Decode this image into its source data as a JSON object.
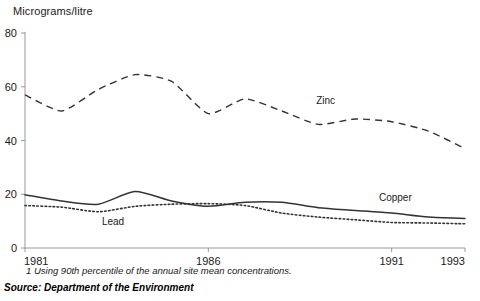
{
  "axis_title": "Micrograms/litre",
  "footnote": "1 Using 90th percentile of the annual site mean concentrations.",
  "source": "Source: Department of the Environment",
  "colors": {
    "line": "#333333",
    "axis": "#999999",
    "text": "#1a1a1a"
  },
  "chart_data": {
    "type": "line",
    "title": "",
    "subtitle": "",
    "xlabel": "",
    "ylabel": "Micrograms/litre",
    "ylim": [
      0,
      80
    ],
    "yticks": [
      0,
      20,
      40,
      60,
      80
    ],
    "xlim": [
      1981,
      1993
    ],
    "xticks": [
      1981,
      1986,
      1991,
      1993
    ],
    "xticklabels": [
      "1981",
      "1986",
      "1991",
      "1993"
    ],
    "grid": false,
    "legend": "inline-labels",
    "x": [
      1981,
      1982,
      1983,
      1984,
      1985,
      1986,
      1987,
      1988,
      1989,
      1990,
      1991,
      1992,
      1993
    ],
    "series": [
      {
        "name": "Zinc",
        "style": "dashed",
        "label_x": 1989.2,
        "label_y": 53.5,
        "values": [
          57,
          51,
          59,
          64.5,
          62,
          50,
          55.5,
          51,
          46,
          48,
          47,
          43.5,
          37
        ]
      },
      {
        "name": "Copper",
        "style": "solid",
        "label_x": 1991.1,
        "label_y": 17.5,
        "values": [
          19.8,
          17.5,
          16.3,
          21,
          17.5,
          15.5,
          17,
          17,
          15,
          14,
          13,
          11.5,
          11
        ]
      },
      {
        "name": "Lead",
        "style": "dotted",
        "label_x": 1983.4,
        "label_y": 8.5,
        "values": [
          15.8,
          15.2,
          13.5,
          15.5,
          16.3,
          16.5,
          15.8,
          13,
          11.5,
          10.5,
          9.5,
          9.3,
          9
        ]
      }
    ]
  }
}
